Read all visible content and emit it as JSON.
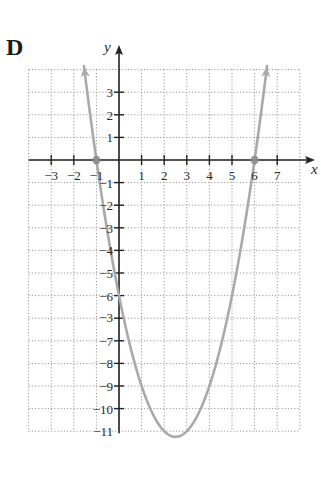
{
  "panel": {
    "label": "D"
  },
  "chart_data": {
    "type": "line",
    "title": "",
    "xlabel": "x",
    "ylabel": "y",
    "xlim": [
      -4,
      8
    ],
    "ylim": [
      -12,
      4
    ],
    "grid": true,
    "grid_style": "dotted",
    "x_ticks": [
      -3,
      -2,
      -1,
      1,
      2,
      3,
      4,
      5,
      6,
      7
    ],
    "x_tick_labels": [
      "−3",
      "−2",
      "−1",
      "1",
      "2",
      "3",
      "4",
      "5",
      "6",
      "7"
    ],
    "y_ticks": [
      3,
      2,
      1,
      -1,
      -2,
      -3,
      -4,
      -5,
      -6,
      -7,
      -8,
      -9,
      -10,
      -11
    ],
    "y_tick_labels": [
      "3",
      "2",
      "1",
      "−1",
      "−2",
      "−3",
      "−4",
      "−5",
      "−6",
      "−3",
      "−7",
      "−8",
      "−9",
      "−10",
      "−11"
    ],
    "y_tick_label_positions": [
      3,
      2,
      1,
      -1,
      -2,
      -3,
      -4,
      -5,
      -6,
      -7,
      -8,
      -9,
      -10,
      -11,
      -12
    ],
    "series": [
      {
        "name": "y = x^2 - 5x - 6",
        "function": "x^2 - 5x - 6",
        "x_range": [
          -1.55,
          6.55
        ],
        "color": "#a9a9a9",
        "arrows_both_ends": true,
        "points": [
          [
            -1.5,
            3.75
          ],
          [
            -1,
            0
          ],
          [
            0,
            -6
          ],
          [
            1,
            -10
          ],
          [
            2,
            -12
          ],
          [
            2.5,
            -12.25
          ],
          [
            3,
            -12
          ],
          [
            4,
            -10
          ],
          [
            5,
            -6
          ],
          [
            6,
            0
          ],
          [
            6.5,
            3.75
          ]
        ]
      }
    ],
    "highlighted_points": [
      {
        "x": -1,
        "y": 0,
        "label": "x-intercept"
      },
      {
        "x": 6,
        "y": 0,
        "label": "x-intercept"
      }
    ],
    "vertex": {
      "x": 2.5,
      "y": -12.25
    }
  }
}
